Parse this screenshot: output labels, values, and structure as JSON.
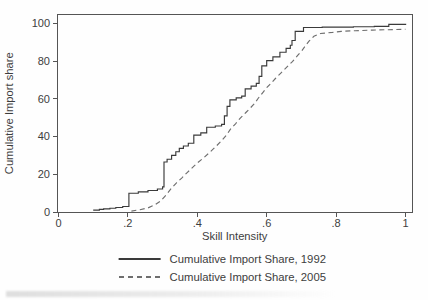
{
  "chart_data": {
    "type": "line",
    "subtype": "cumulative-step",
    "title": "",
    "xlabel": "Skill Intensity",
    "ylabel": "Cumulative Import share",
    "xlim": [
      0,
      1.02
    ],
    "ylim": [
      0,
      104
    ],
    "grid": false,
    "frame": true,
    "legend_position": "bottom-center",
    "x_ticks": [
      0,
      0.2,
      0.4,
      0.6,
      0.8,
      1
    ],
    "x_tick_labels": [
      "0",
      ".2",
      ".4",
      ".6",
      ".8",
      "1"
    ],
    "y_ticks": [
      0,
      20,
      40,
      60,
      80,
      100
    ],
    "y_tick_labels": [
      "0",
      "20",
      "40",
      "60",
      "80",
      "100"
    ],
    "axis_color": "#555555",
    "text_color": "#3d3d3d",
    "series": [
      {
        "name": "Cumulative Import Share, 1992",
        "style": "solid",
        "color": "#3a3a3a",
        "points": [
          [
            0.1,
            1
          ],
          [
            0.118,
            1.4
          ],
          [
            0.13,
            1.7
          ],
          [
            0.148,
            2.0
          ],
          [
            0.165,
            2.4
          ],
          [
            0.185,
            2.9
          ],
          [
            0.203,
            10
          ],
          [
            0.23,
            10.7
          ],
          [
            0.258,
            11.4
          ],
          [
            0.285,
            12.2
          ],
          [
            0.3,
            13.3
          ],
          [
            0.304,
            26.5
          ],
          [
            0.313,
            28
          ],
          [
            0.326,
            30
          ],
          [
            0.338,
            32
          ],
          [
            0.348,
            33.8
          ],
          [
            0.36,
            35
          ],
          [
            0.374,
            36.5
          ],
          [
            0.39,
            40.8
          ],
          [
            0.41,
            42
          ],
          [
            0.427,
            45
          ],
          [
            0.452,
            45.6
          ],
          [
            0.47,
            46.5
          ],
          [
            0.478,
            51
          ],
          [
            0.486,
            56
          ],
          [
            0.494,
            59.5
          ],
          [
            0.512,
            60.6
          ],
          [
            0.528,
            61.5
          ],
          [
            0.538,
            65.3
          ],
          [
            0.555,
            66.8
          ],
          [
            0.57,
            68.3
          ],
          [
            0.578,
            72
          ],
          [
            0.586,
            77.5
          ],
          [
            0.6,
            80.3
          ],
          [
            0.618,
            82.3
          ],
          [
            0.638,
            84.8
          ],
          [
            0.656,
            86.8
          ],
          [
            0.668,
            88.5
          ],
          [
            0.673,
            91
          ],
          [
            0.682,
            95.8
          ],
          [
            0.706,
            97.9
          ],
          [
            0.76,
            98.1
          ],
          [
            0.85,
            98.3
          ],
          [
            0.91,
            98.5
          ],
          [
            0.952,
            99.6
          ],
          [
            1.002,
            99.6
          ]
        ]
      },
      {
        "name": "Cumulative Import Share, 2005",
        "style": "dashed",
        "color": "#6e6e6e",
        "points": [
          [
            0.21,
            0.5
          ],
          [
            0.235,
            1.2
          ],
          [
            0.258,
            2.2
          ],
          [
            0.278,
            3.8
          ],
          [
            0.295,
            6
          ],
          [
            0.31,
            9
          ],
          [
            0.325,
            12.5
          ],
          [
            0.34,
            15.5
          ],
          [
            0.355,
            18
          ],
          [
            0.37,
            20.8
          ],
          [
            0.385,
            23.4
          ],
          [
            0.4,
            26
          ],
          [
            0.42,
            29
          ],
          [
            0.438,
            32
          ],
          [
            0.455,
            35
          ],
          [
            0.47,
            37.8
          ],
          [
            0.485,
            41
          ],
          [
            0.495,
            43.8
          ],
          [
            0.51,
            46.8
          ],
          [
            0.524,
            49.8
          ],
          [
            0.54,
            52.8
          ],
          [
            0.552,
            55
          ],
          [
            0.565,
            57.6
          ],
          [
            0.576,
            60.5
          ],
          [
            0.59,
            63.6
          ],
          [
            0.6,
            66
          ],
          [
            0.614,
            68.6
          ],
          [
            0.625,
            70.8
          ],
          [
            0.64,
            73.6
          ],
          [
            0.65,
            75.4
          ],
          [
            0.662,
            77.6
          ],
          [
            0.674,
            79.8
          ],
          [
            0.69,
            83.2
          ],
          [
            0.702,
            85.8
          ],
          [
            0.712,
            88.3
          ],
          [
            0.722,
            90.6
          ],
          [
            0.736,
            93.2
          ],
          [
            0.755,
            94.7
          ],
          [
            0.79,
            95.3
          ],
          [
            0.815,
            95.8
          ],
          [
            0.855,
            96.2
          ],
          [
            0.905,
            96.5
          ],
          [
            0.95,
            96.7
          ],
          [
            1.0,
            97.0
          ]
        ]
      }
    ]
  }
}
